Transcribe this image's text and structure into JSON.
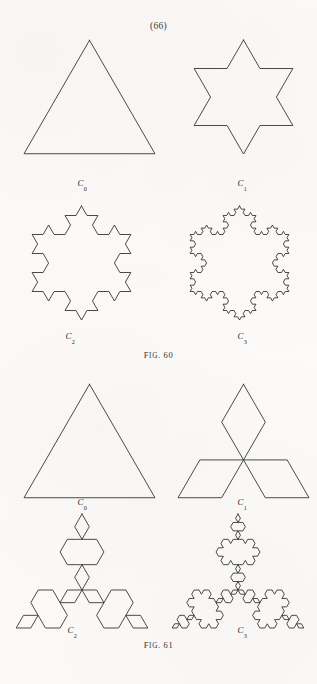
{
  "page": {
    "page_number": "(66)",
    "background_color": "#fcfbfa",
    "ink_color": "#2b2b29",
    "width": 317,
    "height": 684
  },
  "figures": [
    {
      "id": "fig-60",
      "caption_prefix": "F",
      "caption_smallcaps": "IG",
      "caption_suffix": ". 60",
      "caption_full": "Fig. 60",
      "caption_number": "60",
      "description": "Koch snowflake construction, outward iterations",
      "koch_direction": "outward",
      "cells": [
        {
          "label_text": "C",
          "label_sub": "0",
          "iteration": 0,
          "x": 22,
          "y": 38,
          "w": 135,
          "h": 118,
          "label_x": 52,
          "label_y": 178
        },
        {
          "label_text": "C",
          "label_sub": "1",
          "iteration": 1,
          "x": 176,
          "y": 38,
          "w": 135,
          "h": 118,
          "label_x": 212,
          "label_y": 178
        },
        {
          "label_text": "C",
          "label_sub": "2",
          "iteration": 2,
          "x": 14,
          "y": 204,
          "w": 135,
          "h": 118,
          "label_x": 40,
          "label_y": 331
        },
        {
          "label_text": "C",
          "label_sub": "3",
          "iteration": 3,
          "x": 172,
          "y": 204,
          "w": 135,
          "h": 118,
          "label_x": 212,
          "label_y": 331
        }
      ],
      "caption_y": 350
    },
    {
      "id": "fig-61",
      "caption_prefix": "F",
      "caption_smallcaps": "IG",
      "caption_suffix": ". 61",
      "caption_full": "Fig. 61",
      "caption_number": "61",
      "description": "Koch anti-snowflake construction, inward iterations",
      "koch_direction": "inward",
      "cells": [
        {
          "label_text": "C",
          "label_sub": "0",
          "iteration": 0,
          "x": 22,
          "y": 382,
          "w": 135,
          "h": 118,
          "label_x": 52,
          "label_y": 497
        },
        {
          "label_text": "C",
          "label_sub": "1",
          "iteration": 1,
          "x": 176,
          "y": 382,
          "w": 135,
          "h": 118,
          "label_x": 212,
          "label_y": 497
        },
        {
          "label_text": "C",
          "label_sub": "2",
          "iteration": 2,
          "x": 12,
          "y": 512,
          "w": 140,
          "h": 118,
          "label_x": 42,
          "label_y": 625
        },
        {
          "label_text": "C",
          "label_sub": "3",
          "iteration": 3,
          "x": 168,
          "y": 512,
          "w": 140,
          "h": 118,
          "label_x": 212,
          "label_y": 625
        }
      ],
      "caption_y": 640
    }
  ],
  "geometry": {
    "stroke_width": 0.85,
    "snowflake_triangle_scale": 0.8,
    "antiflake_triangle_scale": 0.8
  }
}
